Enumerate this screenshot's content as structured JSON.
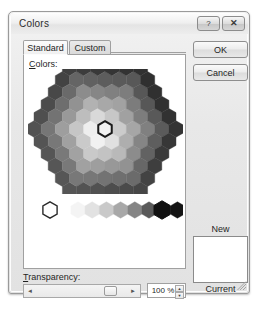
{
  "window": {
    "title": "Colors",
    "help_button_glyph": "?",
    "close_button_glyph": "✕"
  },
  "tabs": [
    {
      "label": "Standard",
      "active": true
    },
    {
      "label": "Custom",
      "active": false
    }
  ],
  "colors_panel": {
    "label_prefix": "C",
    "label_rest": "olors:"
  },
  "buttons": {
    "ok": "OK",
    "cancel": "Cancel"
  },
  "preview": {
    "new_label": "New",
    "current_label": "Current",
    "new_color": "#ffffff",
    "current_color": "#ffffff"
  },
  "transparency": {
    "label_prefix": "T",
    "label_rest": "ransparency:",
    "value": "100 %",
    "slider_position_percent": 92,
    "arrow_left_glyph": "◄",
    "arrow_right_glyph": "►",
    "spin_up_glyph": "▲",
    "spin_down_glyph": "▼"
  },
  "ghost_text": {
    "top": "",
    "bottom": ""
  },
  "honeycomb": {
    "selected_index": 45,
    "ring_shades": [
      "#2f2f2f",
      "#474747",
      "#6e6e6e",
      "#9a9a9a",
      "#c2c2c2",
      "#dedede",
      "#efefef"
    ]
  },
  "swatch_strip": {
    "white_hex": "#ffffff",
    "gradient": [
      "#f4f4f4",
      "#e2e2e2",
      "#c9c9c9",
      "#a8a8a8",
      "#858585",
      "#5a5a5a",
      "#2e2e2e",
      "#141414"
    ],
    "black_hex": "#111111"
  }
}
